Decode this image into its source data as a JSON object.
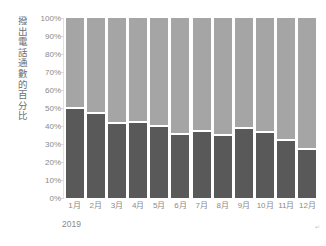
{
  "chart_data": {
    "type": "bar",
    "title": "",
    "subtitle": "",
    "ylabel": "撥出電話通數的百分比",
    "xlabel": "2019",
    "categories": [
      "1月",
      "2月",
      "3月",
      "4月",
      "5月",
      "6月",
      "7月",
      "8月",
      "9月",
      "10月",
      "11月",
      "12月"
    ],
    "series": [
      {
        "name": "bottom-segment",
        "color": "#595959",
        "values": [
          50.5,
          48.0,
          42.0,
          43.0,
          40.5,
          36.0,
          38.0,
          35.5,
          39.5,
          37.0,
          33.0,
          28.0
        ]
      },
      {
        "name": "top-segment",
        "color": "#a5a5a5",
        "values": [
          49.5,
          52.0,
          58.0,
          57.0,
          59.5,
          64.0,
          62.0,
          64.5,
          60.5,
          63.0,
          67.0,
          72.0
        ]
      }
    ],
    "stacked": true,
    "ylim": [
      0,
      100
    ],
    "ytick_labels": [
      "100%",
      "90%",
      "80%",
      "70%",
      "60%",
      "50%",
      "40%",
      "30%",
      "20%",
      "10%",
      "0%"
    ],
    "ytick_values": [
      100,
      90,
      80,
      70,
      60,
      50,
      40,
      30,
      20,
      10,
      0
    ],
    "grid": false,
    "legend": "none",
    "corner_mark": "↵"
  }
}
